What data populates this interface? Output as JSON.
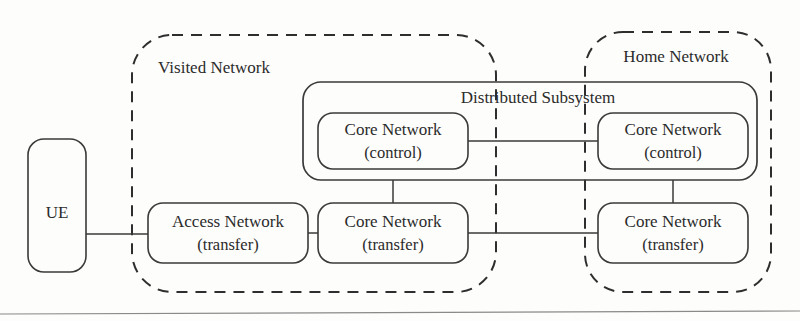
{
  "figure": {
    "type": "network-architecture-diagram"
  },
  "zones": [
    {
      "id": "visited-network",
      "label": "Visited Network",
      "style": "dashed",
      "label_x": 214,
      "label_y": 73,
      "x": 132,
      "y": 35,
      "width": 364,
      "height": 257,
      "radius": 40
    },
    {
      "id": "home-network",
      "label": "Home Network",
      "style": "dashed",
      "label_x": 676,
      "label_y": 62,
      "x": 585,
      "y": 32,
      "width": 186,
      "height": 260,
      "radius": 38
    }
  ],
  "containers": [
    {
      "id": "distributed-subsystem",
      "label": "Distributed Subsystem",
      "style": "solid",
      "label_x": 538,
      "label_y": 103,
      "x": 303,
      "y": 82,
      "width": 454,
      "height": 98,
      "radius": 18
    }
  ],
  "nodes": [
    {
      "id": "ue",
      "lines": [
        "UE"
      ],
      "x": 28,
      "y": 139,
      "width": 58,
      "height": 133,
      "radius": 16,
      "cx": 57,
      "cy": 212
    },
    {
      "id": "access-network-transfer",
      "lines": [
        "Access Network",
        "(transfer)"
      ],
      "x": 148,
      "y": 203,
      "width": 160,
      "height": 60,
      "radius": 15,
      "cx": 228,
      "cy": 226
    },
    {
      "id": "core-network-transfer-visited",
      "lines": [
        "Core Network",
        "(transfer)"
      ],
      "x": 318,
      "y": 203,
      "width": 150,
      "height": 60,
      "radius": 15,
      "cx": 393,
      "cy": 226
    },
    {
      "id": "core-network-control-visited",
      "lines": [
        "Core Network",
        "(control)"
      ],
      "x": 318,
      "y": 113,
      "width": 150,
      "height": 56,
      "radius": 15,
      "cx": 393,
      "cy": 134
    },
    {
      "id": "core-network-control-home",
      "lines": [
        "Core Network",
        "(control)"
      ],
      "x": 598,
      "y": 113,
      "width": 150,
      "height": 56,
      "radius": 15,
      "cx": 673,
      "cy": 134
    },
    {
      "id": "core-network-transfer-home",
      "lines": [
        "Core Network",
        "(transfer)"
      ],
      "x": 598,
      "y": 203,
      "width": 150,
      "height": 60,
      "radius": 15,
      "cx": 673,
      "cy": 226
    }
  ],
  "links": [
    {
      "id": "ue-to-access",
      "from": "ue",
      "to": "access-network-transfer",
      "d": "M 86 234 L 148 234"
    },
    {
      "id": "access-to-core-transfer-visited",
      "from": "access-network-transfer",
      "to": "core-network-transfer-visited",
      "d": "M 308 233 L 318 233"
    },
    {
      "id": "core-transfer-visited-to-core-transfer-home",
      "from": "core-network-transfer-visited",
      "to": "core-network-transfer-home",
      "d": "M 468 233 L 598 233"
    },
    {
      "id": "core-control-visited-to-core-control-home",
      "from": "core-network-control-visited",
      "to": "core-network-control-home",
      "d": "M 468 141 L 598 141"
    },
    {
      "id": "subsystem-to-core-transfer-visited",
      "from": "distributed-subsystem",
      "to": "core-network-transfer-visited",
      "d": "M 393 180 L 393 203"
    },
    {
      "id": "subsystem-to-core-transfer-home",
      "from": "distributed-subsystem",
      "to": "core-network-transfer-home",
      "d": "M 673 180 L 673 203"
    }
  ],
  "page_rule": {
    "id": "page-bottom-rule",
    "d": "M 0 314 L 800 311"
  },
  "colors": {
    "stroke": "#3a3a3a",
    "zone_stroke": "#2e2e2e",
    "text": "#2b2b2b",
    "background": "#fdfdfb",
    "rule": "#8a8a8a"
  }
}
